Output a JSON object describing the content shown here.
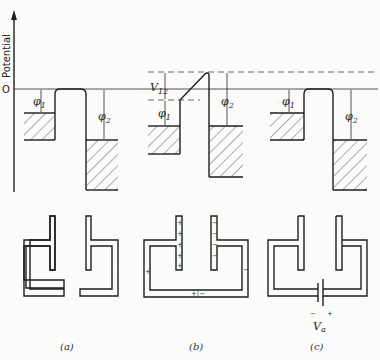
{
  "figure": {
    "axis": {
      "ylabel": "Potential",
      "zero_label": "O"
    },
    "panels": [
      {
        "id": "a",
        "caption": "(a)",
        "phi1": "φ",
        "phi1_sub": "1",
        "phi2": "φ",
        "phi2_sub": "2"
      },
      {
        "id": "b",
        "caption": "(b)",
        "phi1": "φ",
        "phi1_sub": "1",
        "phi2": "φ",
        "phi2_sub": "2",
        "v12": "V",
        "v12_sub": "12",
        "left_charge": "+",
        "right_charge": "−",
        "junction_label": "+|−"
      },
      {
        "id": "c",
        "caption": "(c)",
        "phi1": "φ",
        "phi1_sub": "1",
        "phi2": "φ",
        "phi2_sub": "2",
        "battery_label": "V",
        "battery_sub": "a",
        "battery_minus": "−",
        "battery_plus": "+"
      }
    ]
  },
  "colors": {
    "ink": "#1e1e1e",
    "background": "#fbfbf9"
  }
}
